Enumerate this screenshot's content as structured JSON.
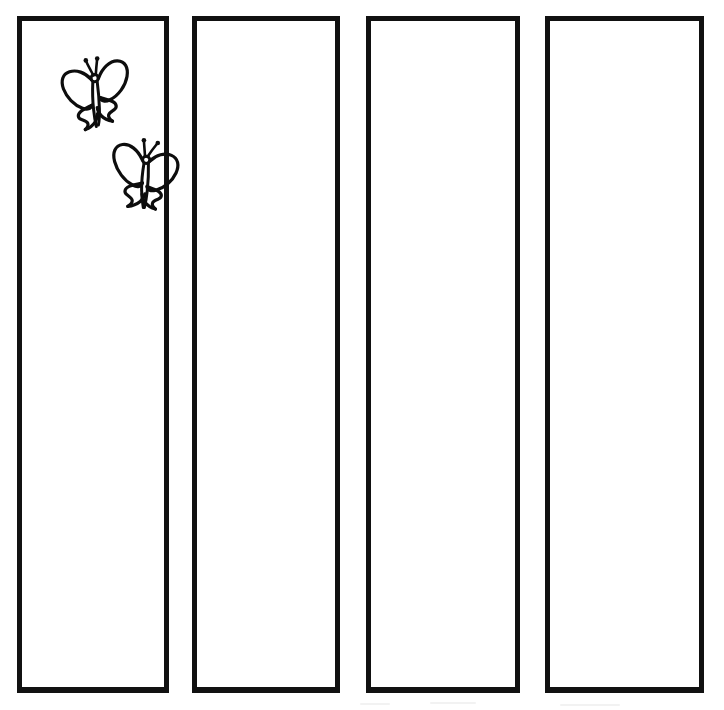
{
  "page": {
    "title": "Butterfly Bookmark Strips Template",
    "background_color": "#ffffff",
    "ink_color": "#0d0d0d",
    "width": 724,
    "height": 710
  },
  "strips": [
    {
      "id": "strip-1",
      "label": "",
      "decoration": "two-butterflies",
      "empty": false
    },
    {
      "id": "strip-2",
      "label": "",
      "decoration": "none",
      "empty": true
    },
    {
      "id": "strip-3",
      "label": "",
      "decoration": "none",
      "empty": true
    },
    {
      "id": "strip-4",
      "label": "",
      "decoration": "none",
      "empty": true
    }
  ],
  "decorations": [
    {
      "id": "butterfly-upper",
      "name": "butterfly-icon",
      "in_strip": "strip-1",
      "style": "line-art-outline"
    },
    {
      "id": "butterfly-lower",
      "name": "butterfly-icon",
      "in_strip": "strip-1",
      "style": "line-art-outline"
    }
  ]
}
